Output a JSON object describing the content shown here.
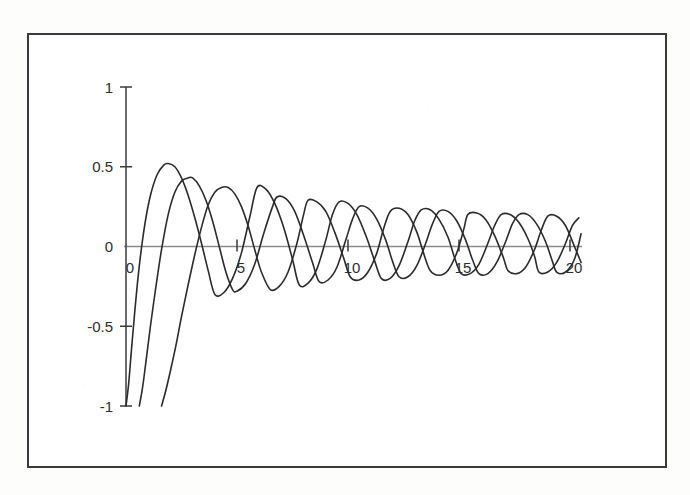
{
  "figure": {
    "border_color": "#3a3a3a",
    "background_color": "#ffffff"
  },
  "chart_data": {
    "type": "line",
    "title": "",
    "subtitle": "",
    "xlabel": "",
    "ylabel": "",
    "xlim": [
      -0.2,
      20.6
    ],
    "ylim": [
      -1.05,
      1.0
    ],
    "grid": false,
    "legend": null,
    "legend_position": "none",
    "axis_style": {
      "zero_line_color": "#8b8b8b",
      "y_axis_color": "#3a3a3a",
      "curve_color": "#2b2b2b",
      "curve_width": 1.6
    },
    "x_ticks": [
      0,
      5,
      10,
      15,
      20
    ],
    "x_tick_labels": [
      "0",
      "5",
      "10",
      "15",
      "20"
    ],
    "y_ticks": [
      1,
      0.5,
      0,
      -0.5,
      -1
    ],
    "y_tick_labels": [
      "1",
      "0.5",
      "0",
      "-0.5",
      "-1"
    ],
    "annotations": [],
    "series": [
      {
        "name": "curve-1",
        "phase_shift": 0.0,
        "start_value": -1.0,
        "peaks": [
          {
            "x": 1.9,
            "y": 0.52
          },
          {
            "x": 5.9,
            "y": 0.37
          },
          {
            "x": 9.6,
            "y": 0.28
          },
          {
            "x": 13.3,
            "y": 0.23
          },
          {
            "x": 16.9,
            "y": 0.2
          },
          {
            "x": 20.2,
            "y": 0.18
          }
        ],
        "troughs": [
          {
            "x": 4.0,
            "y": -0.3
          },
          {
            "x": 7.8,
            "y": -0.24
          },
          {
            "x": 11.5,
            "y": -0.2
          },
          {
            "x": 15.1,
            "y": -0.17
          },
          {
            "x": 18.6,
            "y": -0.16
          }
        ],
        "x": [
          0.0,
          0.12,
          0.25,
          0.4,
          0.6,
          0.85,
          1.1,
          1.4,
          1.7,
          1.9,
          2.2,
          2.5,
          2.8,
          3.1,
          3.4,
          3.7,
          4.0,
          4.4,
          4.8,
          5.2,
          5.6,
          5.9,
          6.3,
          6.7,
          7.1,
          7.5,
          7.8,
          8.2,
          8.6,
          9.0,
          9.3,
          9.6,
          10.0,
          10.4,
          10.8,
          11.2,
          11.5,
          11.9,
          12.3,
          12.7,
          13.0,
          13.3,
          13.7,
          14.1,
          14.5,
          14.8,
          15.1,
          15.5,
          15.9,
          16.3,
          16.6,
          16.9,
          17.3,
          17.7,
          18.1,
          18.4,
          18.6,
          19.0,
          19.4,
          19.8,
          20.1,
          20.4
        ],
        "y": [
          -1.0,
          -0.86,
          -0.64,
          -0.4,
          -0.12,
          0.14,
          0.32,
          0.45,
          0.51,
          0.52,
          0.5,
          0.43,
          0.32,
          0.18,
          0.02,
          -0.15,
          -0.3,
          -0.29,
          -0.2,
          -0.04,
          0.2,
          0.37,
          0.36,
          0.27,
          0.12,
          -0.08,
          -0.24,
          -0.23,
          -0.14,
          0.04,
          0.2,
          0.28,
          0.27,
          0.2,
          0.07,
          -0.09,
          -0.2,
          -0.2,
          -0.12,
          0.03,
          0.16,
          0.23,
          0.23,
          0.17,
          0.06,
          -0.07,
          -0.17,
          -0.17,
          -0.11,
          0.02,
          0.13,
          0.2,
          0.2,
          0.15,
          0.05,
          -0.06,
          -0.16,
          -0.16,
          -0.1,
          0.02,
          0.13,
          0.18
        ]
      },
      {
        "name": "curve-2",
        "phase_shift": 0.6,
        "start_value": -1.0,
        "peaks": [
          {
            "x": 3.0,
            "y": 0.43
          },
          {
            "x": 6.8,
            "y": 0.31
          },
          {
            "x": 10.5,
            "y": 0.25
          },
          {
            "x": 14.1,
            "y": 0.22
          },
          {
            "x": 17.7,
            "y": 0.2
          },
          {
            "x": 20.4,
            "y": 0.14
          }
        ],
        "troughs": [
          {
            "x": 5.0,
            "y": -0.28
          },
          {
            "x": 8.7,
            "y": -0.22
          },
          {
            "x": 12.3,
            "y": -0.19
          },
          {
            "x": 15.9,
            "y": -0.17
          },
          {
            "x": 19.4,
            "y": -0.16
          }
        ],
        "x": [
          0.6,
          0.75,
          0.9,
          1.1,
          1.35,
          1.6,
          1.9,
          2.2,
          2.5,
          2.8,
          3.0,
          3.3,
          3.6,
          3.9,
          4.2,
          4.5,
          4.8,
          5.0,
          5.4,
          5.8,
          6.2,
          6.6,
          6.8,
          7.2,
          7.6,
          8.0,
          8.4,
          8.7,
          9.1,
          9.5,
          9.9,
          10.2,
          10.5,
          10.9,
          11.3,
          11.7,
          12.0,
          12.3,
          12.7,
          13.1,
          13.5,
          13.8,
          14.1,
          14.5,
          14.9,
          15.3,
          15.6,
          15.9,
          16.3,
          16.7,
          17.1,
          17.4,
          17.7,
          18.1,
          18.5,
          18.9,
          19.2,
          19.4,
          19.8,
          20.2,
          20.5
        ],
        "y": [
          -1.0,
          -0.88,
          -0.72,
          -0.5,
          -0.25,
          -0.02,
          0.2,
          0.34,
          0.41,
          0.43,
          0.43,
          0.38,
          0.29,
          0.16,
          0.0,
          -0.16,
          -0.27,
          -0.28,
          -0.23,
          -0.11,
          0.08,
          0.25,
          0.31,
          0.3,
          0.22,
          0.07,
          -0.1,
          -0.22,
          -0.21,
          -0.13,
          0.04,
          0.17,
          0.25,
          0.24,
          0.17,
          0.04,
          -0.09,
          -0.19,
          -0.19,
          -0.12,
          0.02,
          0.14,
          0.22,
          0.22,
          0.16,
          0.04,
          -0.08,
          -0.17,
          -0.17,
          -0.1,
          0.03,
          0.14,
          0.2,
          0.2,
          0.14,
          0.03,
          -0.09,
          -0.16,
          -0.16,
          -0.08,
          0.08
        ]
      },
      {
        "name": "curve-3",
        "phase_shift": 1.6,
        "start_value": -1.0,
        "peaks": [
          {
            "x": 4.6,
            "y": 0.37
          },
          {
            "x": 8.2,
            "y": 0.29
          },
          {
            "x": 11.9,
            "y": 0.24
          },
          {
            "x": 15.4,
            "y": 0.21
          },
          {
            "x": 19.0,
            "y": 0.19
          }
        ],
        "troughs": [
          {
            "x": 6.5,
            "y": -0.27
          },
          {
            "x": 10.1,
            "y": -0.21
          },
          {
            "x": 13.7,
            "y": -0.18
          },
          {
            "x": 17.2,
            "y": -0.17
          },
          {
            "x": 20.5,
            "y": -0.1
          }
        ],
        "x": [
          1.6,
          1.8,
          2.0,
          2.25,
          2.5,
          2.8,
          3.1,
          3.4,
          3.7,
          4.0,
          4.3,
          4.6,
          4.9,
          5.2,
          5.5,
          5.8,
          6.1,
          6.5,
          6.9,
          7.3,
          7.7,
          8.0,
          8.2,
          8.6,
          9.0,
          9.4,
          9.8,
          10.1,
          10.5,
          10.9,
          11.3,
          11.6,
          11.9,
          12.3,
          12.7,
          13.1,
          13.4,
          13.7,
          14.1,
          14.5,
          14.9,
          15.2,
          15.4,
          15.8,
          16.2,
          16.6,
          17.0,
          17.2,
          17.6,
          18.0,
          18.4,
          18.7,
          19.0,
          19.4,
          19.8,
          20.2,
          20.5
        ],
        "y": [
          -1.0,
          -0.9,
          -0.78,
          -0.62,
          -0.44,
          -0.24,
          -0.05,
          0.12,
          0.26,
          0.34,
          0.37,
          0.37,
          0.33,
          0.25,
          0.13,
          -0.02,
          -0.16,
          -0.27,
          -0.25,
          -0.16,
          0.02,
          0.2,
          0.29,
          0.28,
          0.22,
          0.09,
          -0.07,
          -0.19,
          -0.21,
          -0.16,
          -0.04,
          0.11,
          0.22,
          0.24,
          0.2,
          0.09,
          -0.04,
          -0.15,
          -0.18,
          -0.15,
          -0.04,
          0.1,
          0.2,
          0.21,
          0.17,
          0.07,
          -0.07,
          -0.15,
          -0.17,
          -0.13,
          -0.02,
          0.1,
          0.19,
          0.19,
          0.13,
          0.0,
          -0.1
        ]
      }
    ]
  }
}
